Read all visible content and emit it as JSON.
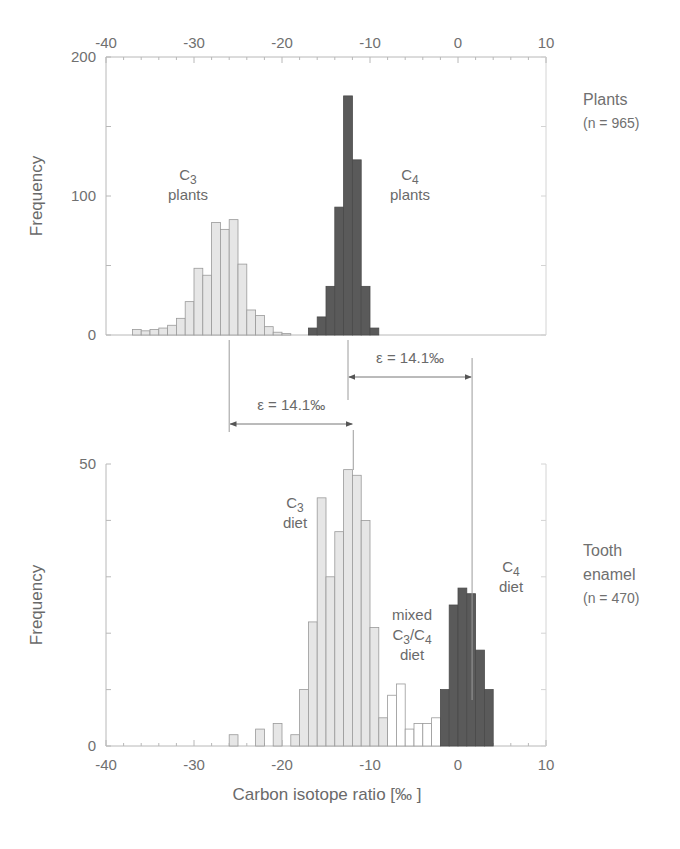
{
  "chart_data": [
    {
      "type": "bar",
      "panel": "top",
      "title": "",
      "xlabel": "",
      "ylabel": "Frequency",
      "xlim": [
        -40,
        10
      ],
      "ylim": [
        0,
        200
      ],
      "x_ticks": [
        -40,
        -30,
        -20,
        -10,
        0,
        10
      ],
      "y_ticks": [
        0,
        100,
        200
      ],
      "x_tick_position": "top",
      "bin_width": 1,
      "side_label": [
        "Plants",
        "(n = 965)"
      ],
      "series": [
        {
          "name": "C3 plants",
          "label_lines": [
            "C3",
            "plants"
          ],
          "color": "#e6e6e6",
          "bin_starts": [
            -37,
            -36,
            -35,
            -34,
            -33,
            -32,
            -31,
            -30,
            -29,
            -28,
            -27,
            -26,
            -25,
            -24,
            -23,
            -22,
            -21,
            -20
          ],
          "values": [
            4,
            3,
            4,
            5,
            7,
            12,
            24,
            48,
            43,
            81,
            76,
            83,
            51,
            18,
            14,
            6,
            2,
            1
          ]
        },
        {
          "name": "C4 plants",
          "label_lines": [
            "C4",
            "plants"
          ],
          "color": "#5a5a5a",
          "bin_starts": [
            -17,
            -16,
            -15,
            -14,
            -13,
            -12,
            -11,
            -10
          ],
          "values": [
            5,
            13,
            35,
            92,
            172,
            126,
            35,
            5
          ]
        }
      ]
    },
    {
      "type": "bar",
      "panel": "bottom",
      "title": "",
      "xlabel": "Carbon isotope ratio [‰ ]",
      "ylabel": "Frequency",
      "xlim": [
        -40,
        10
      ],
      "ylim": [
        0,
        50
      ],
      "x_ticks": [
        -40,
        -30,
        -20,
        -10,
        0,
        10
      ],
      "y_ticks": [
        0,
        50
      ],
      "bin_width": 1,
      "side_label": [
        "Tooth",
        "enamel",
        "(n = 470)"
      ],
      "series": [
        {
          "name": "C3 diet",
          "label_lines": [
            "C3",
            "diet"
          ],
          "color": "#e6e6e6",
          "bin_starts": [
            -26,
            -23,
            -21,
            -19,
            -18,
            -17,
            -16,
            -15,
            -14,
            -13,
            -12,
            -11,
            -10,
            -9
          ],
          "values": [
            2,
            3,
            4,
            2,
            10,
            22,
            44,
            30,
            38,
            49,
            48,
            40,
            21,
            5
          ]
        },
        {
          "name": "mixed C3/C4 diet",
          "label_lines": [
            "mixed",
            "C3/C4",
            "diet"
          ],
          "color": "#ffffff",
          "bin_starts": [
            -8,
            -7,
            -6,
            -5,
            -4,
            -3
          ],
          "values": [
            9,
            11,
            3,
            4,
            4,
            5
          ]
        },
        {
          "name": "C4 diet",
          "label_lines": [
            "C4",
            "diet"
          ],
          "color": "#5a5a5a",
          "bin_starts": [
            -2,
            -1,
            0,
            1,
            2,
            3
          ],
          "values": [
            10,
            25,
            28,
            27,
            17,
            10
          ]
        }
      ]
    }
  ],
  "annotations": [
    {
      "name": "enrichment-plants-to-enamel-c4",
      "text": "ε = 14.1‰",
      "from_x": -12.5,
      "to_x": 1.6
    },
    {
      "name": "enrichment-plants-to-enamel-c3",
      "text": "ε = 14.1‰",
      "from_x": -26.0,
      "to_x": -11.9
    }
  ]
}
